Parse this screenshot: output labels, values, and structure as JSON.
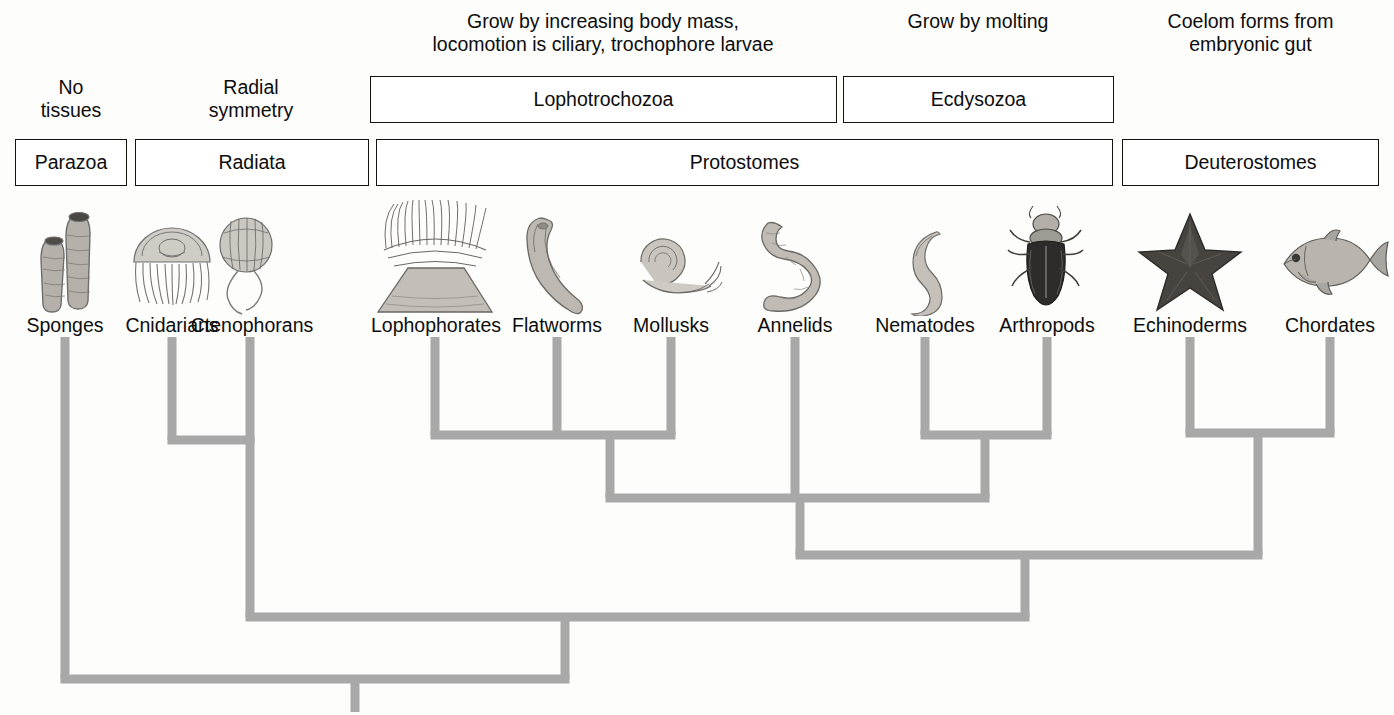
{
  "figure": {
    "kind": "phylogenetic-tree",
    "branch_color": "#a8a8a8",
    "box_border_color": "#14140f",
    "text_color": "#0d0d0d",
    "background_color": "#fdfdfc"
  },
  "annotations": [
    {
      "id": "no-tissues",
      "text": "No\ntissues",
      "cx": 71,
      "top": 76
    },
    {
      "id": "radial-symmetry",
      "text": "Radial\nsymmetry",
      "cx": 251,
      "top": 76
    },
    {
      "id": "lophotrochozoa-traits",
      "text": "Grow by increasing body mass,\nlocomotion is ciliary, trochophore larvae",
      "cx": 603,
      "top": 10
    },
    {
      "id": "ecdysozoa-traits",
      "text": "Grow by molting",
      "cx": 978,
      "top": 10
    },
    {
      "id": "deuterostome-traits",
      "text": "Coelom forms from\nembryonic gut",
      "cx": 1250,
      "top": 10
    }
  ],
  "clade_boxes_upper": [
    {
      "id": "lophotrochozoa",
      "label": "Lophotrochozoa",
      "x": 370,
      "y": 76,
      "w": 467,
      "h": 47
    },
    {
      "id": "ecdysozoa",
      "label": "Ecdysozoa",
      "x": 843,
      "y": 76,
      "w": 271,
      "h": 47
    }
  ],
  "clade_boxes_lower": [
    {
      "id": "parazoa",
      "label": "Parazoa",
      "x": 15,
      "y": 139,
      "w": 112,
      "h": 47
    },
    {
      "id": "radiata",
      "label": "Radiata",
      "x": 135,
      "y": 139,
      "w": 234,
      "h": 47
    },
    {
      "id": "protostomes",
      "label": "Protostomes",
      "x": 376,
      "y": 139,
      "w": 737,
      "h": 47
    },
    {
      "id": "deuterostomes",
      "label": "Deuterostomes",
      "x": 1122,
      "y": 139,
      "w": 257,
      "h": 47
    }
  ],
  "taxa": [
    {
      "id": "sponges",
      "label": "Sponges",
      "x": 65,
      "label_y": 314,
      "organism": "sponge-illustration"
    },
    {
      "id": "cnidarians",
      "label": "Cnidarians",
      "x": 172,
      "label_y": 314,
      "organism": "jellyfish-illustration"
    },
    {
      "id": "ctenophorans",
      "label": "Ctenophorans",
      "x": 250,
      "label_y": 314,
      "organism": "comb-jelly-illustration"
    },
    {
      "id": "lophophorates",
      "label": "Lophophorates",
      "x": 435,
      "label_y": 314,
      "organism": "lophophore-illustration"
    },
    {
      "id": "flatworms",
      "label": "Flatworms",
      "x": 557,
      "label_y": 314,
      "organism": "flatworm-illustration"
    },
    {
      "id": "mollusks",
      "label": "Mollusks",
      "x": 671,
      "label_y": 314,
      "organism": "snail-illustration"
    },
    {
      "id": "annelids",
      "label": "Annelids",
      "x": 795,
      "label_y": 314,
      "organism": "earthworm-illustration"
    },
    {
      "id": "nematodes",
      "label": "Nematodes",
      "x": 925,
      "label_y": 314,
      "organism": "roundworm-illustration"
    },
    {
      "id": "arthropods",
      "label": "Arthropods",
      "x": 1047,
      "label_y": 314,
      "organism": "beetle-illustration"
    },
    {
      "id": "echinoderms",
      "label": "Echinoderms",
      "x": 1190,
      "label_y": 314,
      "organism": "starfish-illustration"
    },
    {
      "id": "chordates",
      "label": "Chordates",
      "x": 1330,
      "label_y": 314,
      "organism": "fish-illustration"
    }
  ],
  "tree_geometry": {
    "stroke_width": 9,
    "tip_y": 337,
    "root_stem_x": 355,
    "root_stem_bottom": 712,
    "nodes": [
      {
        "id": "cnidaria-ctenophora",
        "y": 440,
        "x_from": 172,
        "x_to": 250,
        "parent_x": 250
      },
      {
        "id": "lophotrochozoa-node",
        "y": 435,
        "x_from": 435,
        "x_to": 671,
        "parent_x": 610
      },
      {
        "id": "ecdysozoa-node",
        "y": 435,
        "x_from": 925,
        "x_to": 1047,
        "parent_x": 985
      },
      {
        "id": "deuterostomia-node",
        "y": 433,
        "x_from": 1190,
        "x_to": 1330,
        "parent_x": 1258
      },
      {
        "id": "lophotrochozoa-plus-annelids",
        "y": 498,
        "x_from": 610,
        "x_to": 795,
        "parent_x": 800
      },
      {
        "id": "protostomia-node",
        "y": 498,
        "x_from": 610,
        "x_to": 985,
        "parent_x": 800
      },
      {
        "id": "bilateria-node",
        "y": 555,
        "x_from": 800,
        "x_to": 1258,
        "parent_x": 1025
      },
      {
        "id": "eumetazoa-node",
        "y": 617,
        "x_from": 250,
        "x_to": 1025,
        "parent_x": 565
      },
      {
        "id": "metazoa-root",
        "y": 679,
        "x_from": 65,
        "x_to": 565,
        "parent_x": 355
      }
    ]
  }
}
